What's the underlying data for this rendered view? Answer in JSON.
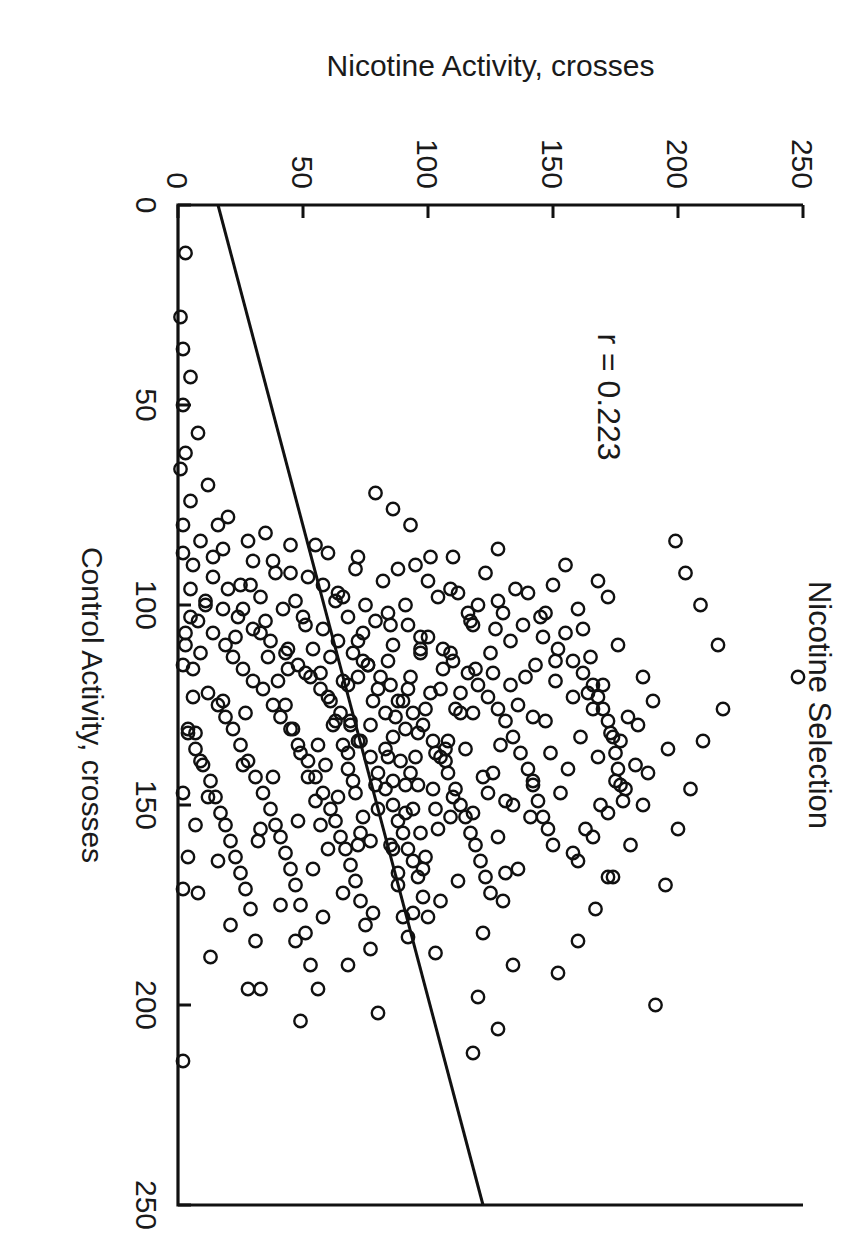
{
  "caption": "417 male and female HS mice.",
  "chart_data": {
    "type": "scatter",
    "title": "Nicotine Selection",
    "xlabel": "Control Activity, crosses",
    "ylabel": "Nicotine Activity, crosses",
    "xlim": [
      0,
      250
    ],
    "ylim": [
      0,
      250
    ],
    "xticks": [
      0,
      50,
      100,
      150,
      200,
      250
    ],
    "yticks": [
      0,
      50,
      100,
      150,
      200,
      250
    ],
    "xticklabels": [
      "0",
      "50",
      "100",
      "150",
      "200",
      "250"
    ],
    "yticklabels": [
      "0",
      "50",
      "100",
      "150",
      "200",
      "250"
    ],
    "grid": false,
    "legend": "none",
    "marker": "open-circle",
    "n_points": 417,
    "annotation": "r = 0.223",
    "correlation_r": 0.223,
    "fit_line": {
      "type": "linear-regression",
      "x_start": 0,
      "y_start": 16,
      "x_end": 250,
      "y_end": 122
    },
    "points": [
      [
        12,
        3
      ],
      [
        28,
        1
      ],
      [
        36,
        2
      ],
      [
        43,
        5
      ],
      [
        50,
        2
      ],
      [
        57,
        8
      ],
      [
        62,
        3
      ],
      [
        66,
        1
      ],
      [
        70,
        12
      ],
      [
        74,
        5
      ],
      [
        78,
        20
      ],
      [
        80,
        2
      ],
      [
        82,
        35
      ],
      [
        84,
        9
      ],
      [
        85,
        55
      ],
      [
        86,
        18
      ],
      [
        87,
        2
      ],
      [
        88,
        72
      ],
      [
        89,
        30
      ],
      [
        90,
        6
      ],
      [
        91,
        88
      ],
      [
        92,
        45
      ],
      [
        93,
        14
      ],
      [
        94,
        100
      ],
      [
        95,
        58
      ],
      [
        95,
        25
      ],
      [
        96,
        5
      ],
      [
        97,
        112
      ],
      [
        98,
        66
      ],
      [
        98,
        33
      ],
      [
        99,
        11
      ],
      [
        100,
        120
      ],
      [
        100,
        75
      ],
      [
        101,
        42
      ],
      [
        101,
        18
      ],
      [
        102,
        130
      ],
      [
        102,
        84
      ],
      [
        103,
        50
      ],
      [
        103,
        24
      ],
      [
        104,
        8
      ],
      [
        105,
        138
      ],
      [
        105,
        92
      ],
      [
        106,
        58
      ],
      [
        106,
        30
      ],
      [
        107,
        14
      ],
      [
        108,
        146
      ],
      [
        108,
        100
      ],
      [
        109,
        64
      ],
      [
        109,
        37
      ],
      [
        110,
        19
      ],
      [
        110,
        3
      ],
      [
        111,
        152
      ],
      [
        111,
        106
      ],
      [
        112,
        70
      ],
      [
        112,
        43
      ],
      [
        113,
        22
      ],
      [
        114,
        158
      ],
      [
        114,
        110
      ],
      [
        115,
        76
      ],
      [
        115,
        48
      ],
      [
        116,
        26
      ],
      [
        116,
        6
      ],
      [
        117,
        162
      ],
      [
        117,
        116
      ],
      [
        118,
        81
      ],
      [
        118,
        53
      ],
      [
        119,
        30
      ],
      [
        120,
        166
      ],
      [
        120,
        120
      ],
      [
        120,
        85
      ],
      [
        121,
        57
      ],
      [
        121,
        34
      ],
      [
        122,
        12
      ],
      [
        123,
        168
      ],
      [
        123,
        124
      ],
      [
        124,
        90
      ],
      [
        124,
        61
      ],
      [
        125,
        38
      ],
      [
        125,
        16
      ],
      [
        126,
        170
      ],
      [
        126,
        128
      ],
      [
        127,
        94
      ],
      [
        127,
        65
      ],
      [
        128,
        41
      ],
      [
        128,
        19
      ],
      [
        129,
        172
      ],
      [
        129,
        131
      ],
      [
        130,
        98
      ],
      [
        130,
        69
      ],
      [
        131,
        45
      ],
      [
        131,
        22
      ],
      [
        132,
        4
      ],
      [
        133,
        174
      ],
      [
        133,
        134
      ],
      [
        134,
        102
      ],
      [
        134,
        73
      ],
      [
        135,
        48
      ],
      [
        135,
        25
      ],
      [
        136,
        7
      ],
      [
        137,
        175
      ],
      [
        137,
        137
      ],
      [
        138,
        105
      ],
      [
        138,
        77
      ],
      [
        139,
        52
      ],
      [
        139,
        28
      ],
      [
        140,
        10
      ],
      [
        141,
        176
      ],
      [
        141,
        140
      ],
      [
        142,
        108
      ],
      [
        142,
        80
      ],
      [
        143,
        55
      ],
      [
        143,
        31
      ],
      [
        144,
        13
      ],
      [
        145,
        177
      ],
      [
        145,
        142
      ],
      [
        146,
        111
      ],
      [
        146,
        83
      ],
      [
        147,
        58
      ],
      [
        147,
        34
      ],
      [
        148,
        15
      ],
      [
        149,
        178
      ],
      [
        149,
        144
      ],
      [
        150,
        113
      ],
      [
        150,
        86
      ],
      [
        151,
        61
      ],
      [
        151,
        37
      ],
      [
        152,
        17
      ],
      [
        153,
        146
      ],
      [
        153,
        115
      ],
      [
        154,
        88
      ],
      [
        154,
        63
      ],
      [
        155,
        39
      ],
      [
        155,
        19
      ],
      [
        156,
        148
      ],
      [
        157,
        117
      ],
      [
        157,
        90
      ],
      [
        158,
        65
      ],
      [
        158,
        41
      ],
      [
        159,
        21
      ],
      [
        160,
        150
      ],
      [
        160,
        119
      ],
      [
        161,
        92
      ],
      [
        161,
        67
      ],
      [
        162,
        43
      ],
      [
        163,
        23
      ],
      [
        164,
        121
      ],
      [
        164,
        94
      ],
      [
        165,
        69
      ],
      [
        166,
        45
      ],
      [
        167,
        25
      ],
      [
        168,
        123
      ],
      [
        168,
        96
      ],
      [
        169,
        71
      ],
      [
        170,
        47
      ],
      [
        171,
        27
      ],
      [
        172,
        125
      ],
      [
        173,
        98
      ],
      [
        174,
        73
      ],
      [
        175,
        49
      ],
      [
        176,
        29
      ],
      [
        178,
        100
      ],
      [
        180,
        75
      ],
      [
        182,
        51
      ],
      [
        184,
        31
      ],
      [
        186,
        77
      ],
      [
        190,
        53
      ],
      [
        196,
        33
      ],
      [
        202,
        80
      ],
      [
        214,
        2
      ],
      [
        95,
        150
      ],
      [
        97,
        140
      ],
      [
        99,
        128
      ],
      [
        101,
        160
      ],
      [
        103,
        145
      ],
      [
        105,
        118
      ],
      [
        107,
        155
      ],
      [
        109,
        133
      ],
      [
        111,
        97
      ],
      [
        113,
        165
      ],
      [
        115,
        143
      ],
      [
        117,
        126
      ],
      [
        119,
        151
      ],
      [
        121,
        105
      ],
      [
        123,
        158
      ],
      [
        125,
        136
      ],
      [
        127,
        113
      ],
      [
        129,
        147
      ],
      [
        131,
        91
      ],
      [
        133,
        161
      ],
      [
        135,
        129
      ],
      [
        137,
        149
      ],
      [
        139,
        107
      ],
      [
        141,
        156
      ],
      [
        143,
        122
      ],
      [
        145,
        96
      ],
      [
        147,
        153
      ],
      [
        149,
        131
      ],
      [
        151,
        103
      ],
      [
        153,
        141
      ],
      [
        88,
        110
      ],
      [
        90,
        95
      ],
      [
        92,
        123
      ],
      [
        94,
        82
      ],
      [
        96,
        135
      ],
      [
        98,
        104
      ],
      [
        100,
        91
      ],
      [
        102,
        116
      ],
      [
        104,
        79
      ],
      [
        106,
        127
      ],
      [
        108,
        97
      ],
      [
        110,
        86
      ],
      [
        112,
        109
      ],
      [
        114,
        74
      ],
      [
        116,
        119
      ],
      [
        118,
        93
      ],
      [
        120,
        68
      ],
      [
        122,
        101
      ],
      [
        124,
        78
      ],
      [
        126,
        111
      ],
      [
        128,
        87
      ],
      [
        130,
        62
      ],
      [
        132,
        96
      ],
      [
        134,
        72
      ],
      [
        136,
        107
      ],
      [
        138,
        84
      ],
      [
        140,
        59
      ],
      [
        142,
        93
      ],
      [
        144,
        70
      ],
      [
        146,
        102
      ],
      [
        85,
        45
      ],
      [
        87,
        60
      ],
      [
        89,
        38
      ],
      [
        91,
        71
      ],
      [
        93,
        52
      ],
      [
        95,
        29
      ],
      [
        97,
        64
      ],
      [
        99,
        47
      ],
      [
        101,
        26
      ],
      [
        103,
        68
      ],
      [
        105,
        51
      ],
      [
        107,
        33
      ],
      [
        109,
        72
      ],
      [
        111,
        54
      ],
      [
        113,
        36
      ],
      [
        115,
        76
      ],
      [
        117,
        57
      ],
      [
        119,
        40
      ],
      [
        121,
        80
      ],
      [
        123,
        60
      ],
      [
        125,
        43
      ],
      [
        127,
        83
      ],
      [
        129,
        63
      ],
      [
        131,
        46
      ],
      [
        133,
        86
      ],
      [
        135,
        66
      ],
      [
        137,
        49
      ],
      [
        139,
        89
      ],
      [
        141,
        68
      ],
      [
        143,
        52
      ],
      [
        145,
        91
      ],
      [
        147,
        71
      ],
      [
        149,
        55
      ],
      [
        151,
        94
      ],
      [
        153,
        74
      ],
      [
        155,
        57
      ],
      [
        157,
        97
      ],
      [
        159,
        77
      ],
      [
        161,
        60
      ],
      [
        163,
        99
      ],
      [
        120,
        170
      ],
      [
        126,
        166
      ],
      [
        132,
        173
      ],
      [
        138,
        168
      ],
      [
        144,
        175
      ],
      [
        150,
        169
      ],
      [
        156,
        163
      ],
      [
        162,
        158
      ],
      [
        128,
        180
      ],
      [
        134,
        177
      ],
      [
        140,
        183
      ],
      [
        146,
        179
      ],
      [
        152,
        172
      ],
      [
        158,
        166
      ],
      [
        164,
        160
      ],
      [
        118,
        186
      ],
      [
        124,
        190
      ],
      [
        130,
        184
      ],
      [
        136,
        196
      ],
      [
        142,
        188
      ],
      [
        112,
        97
      ],
      [
        114,
        84
      ],
      [
        116,
        106
      ],
      [
        118,
        72
      ],
      [
        122,
        113
      ],
      [
        124,
        88
      ],
      [
        126,
        99
      ],
      [
        130,
        77
      ],
      [
        134,
        108
      ],
      [
        136,
        83
      ],
      [
        138,
        95
      ],
      [
        144,
        86
      ],
      [
        148,
        110
      ],
      [
        152,
        91
      ],
      [
        156,
        104
      ],
      [
        160,
        85
      ],
      [
        166,
        98
      ],
      [
        170,
        88
      ],
      [
        174,
        105
      ],
      [
        178,
        90
      ],
      [
        80,
        16
      ],
      [
        84,
        28
      ],
      [
        88,
        14
      ],
      [
        92,
        39
      ],
      [
        96,
        20
      ],
      [
        100,
        11
      ],
      [
        104,
        35
      ],
      [
        108,
        23
      ],
      [
        112,
        9
      ],
      [
        116,
        44
      ],
      [
        124,
        18
      ],
      [
        132,
        7
      ],
      [
        140,
        26
      ],
      [
        148,
        12
      ],
      [
        156,
        33
      ],
      [
        164,
        16
      ],
      [
        172,
        8
      ],
      [
        180,
        21
      ],
      [
        188,
        13
      ],
      [
        196,
        28
      ],
      [
        103,
        5
      ],
      [
        107,
        3
      ],
      [
        115,
        2
      ],
      [
        123,
        6
      ],
      [
        131,
        4
      ],
      [
        139,
        9
      ],
      [
        147,
        2
      ],
      [
        155,
        7
      ],
      [
        163,
        4
      ],
      [
        171,
        2
      ],
      [
        86,
        128
      ],
      [
        90,
        155
      ],
      [
        94,
        168
      ],
      [
        98,
        172
      ],
      [
        102,
        147
      ],
      [
        106,
        162
      ],
      [
        110,
        176
      ],
      [
        114,
        151
      ],
      [
        118,
        139
      ],
      [
        122,
        164
      ],
      [
        150,
        186
      ],
      [
        160,
        181
      ],
      [
        168,
        174
      ],
      [
        176,
        167
      ],
      [
        184,
        160
      ],
      [
        192,
        152
      ],
      [
        200,
        191
      ],
      [
        170,
        195
      ],
      [
        156,
        200
      ],
      [
        146,
        205
      ],
      [
        142,
        126
      ],
      [
        150,
        134
      ],
      [
        158,
        128
      ],
      [
        166,
        136
      ],
      [
        174,
        130
      ],
      [
        182,
        122
      ],
      [
        190,
        134
      ],
      [
        198,
        120
      ],
      [
        206,
        128
      ],
      [
        212,
        118
      ],
      [
        118,
        248
      ],
      [
        126,
        218
      ],
      [
        110,
        216
      ],
      [
        134,
        210
      ],
      [
        100,
        209
      ],
      [
        92,
        203
      ],
      [
        84,
        199
      ],
      [
        168,
        172
      ],
      [
        152,
        118
      ],
      [
        144,
        142
      ],
      [
        136,
        115
      ],
      [
        128,
        142
      ],
      [
        120,
        133
      ],
      [
        112,
        125
      ],
      [
        104,
        117
      ],
      [
        96,
        109
      ],
      [
        88,
        101
      ],
      [
        80,
        93
      ],
      [
        76,
        86
      ],
      [
        72,
        79
      ],
      [
        148,
        64
      ],
      [
        154,
        48
      ],
      [
        160,
        72
      ],
      [
        166,
        54
      ],
      [
        172,
        66
      ],
      [
        178,
        58
      ],
      [
        184,
        47
      ],
      [
        190,
        68
      ],
      [
        196,
        56
      ],
      [
        204,
        49
      ],
      [
        111,
        44
      ],
      [
        119,
        66
      ],
      [
        127,
        27
      ],
      [
        135,
        56
      ],
      [
        143,
        38
      ],
      [
        151,
        80
      ],
      [
        159,
        32
      ],
      [
        167,
        88
      ],
      [
        175,
        41
      ],
      [
        183,
        92
      ],
      [
        105,
        85
      ],
      [
        113,
        61
      ],
      [
        121,
        92
      ],
      [
        129,
        69
      ],
      [
        137,
        103
      ],
      [
        145,
        79
      ],
      [
        153,
        109
      ],
      [
        161,
        86
      ],
      [
        169,
        112
      ],
      [
        177,
        94
      ],
      [
        99,
        63
      ],
      [
        107,
        74
      ],
      [
        117,
        51
      ],
      [
        127,
        118
      ],
      [
        137,
        68
      ],
      [
        147,
        124
      ],
      [
        157,
        73
      ],
      [
        167,
        131
      ],
      [
        177,
        78
      ],
      [
        187,
        103
      ]
    ]
  }
}
